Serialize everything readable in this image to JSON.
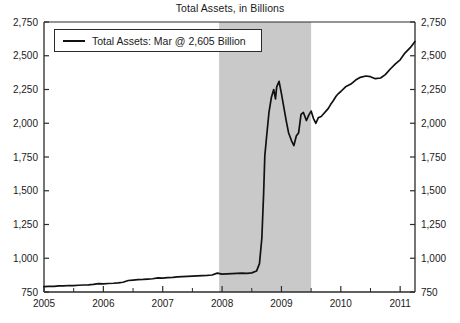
{
  "chart_data": {
    "type": "line",
    "title": "Total Assets, in Billions",
    "xlabel": "",
    "ylabel": "",
    "ylim": [
      750,
      2750
    ],
    "xlim": [
      2005.0,
      2011.25
    ],
    "ytick_labels": [
      "2,750",
      "2,500",
      "2,250",
      "2,000",
      "1,750",
      "1,500",
      "1,250",
      "1,000",
      "750"
    ],
    "ytick_values": [
      2750,
      2500,
      2250,
      2000,
      1750,
      1500,
      1250,
      1000,
      750
    ],
    "xtick_labels": [
      "2005",
      "2006",
      "2007",
      "2008",
      "2009",
      "2010",
      "2011"
    ],
    "xtick_values": [
      2005,
      2006,
      2007,
      2008,
      2009,
      2010,
      2011
    ],
    "minor_xticks": [
      2005.5,
      2006.5,
      2007.5,
      2008.5,
      2009.5,
      2010.5
    ],
    "grid": false,
    "legend_position": "top-left",
    "legend": [
      {
        "name": "Total Assets: Mar @ 2,605 Billion",
        "color": "#111111"
      }
    ],
    "dual_y_axis": true,
    "shaded_regions": [
      {
        "name": "recession",
        "x_start": 2007.95,
        "x_end": 2009.5,
        "color": "#c9c9c9"
      }
    ],
    "series": [
      {
        "name": "Total Assets",
        "color": "#111111",
        "x": [
          2005.0,
          2005.08,
          2005.17,
          2005.25,
          2005.33,
          2005.42,
          2005.5,
          2005.58,
          2005.67,
          2005.75,
          2005.83,
          2005.92,
          2006.0,
          2006.08,
          2006.17,
          2006.25,
          2006.33,
          2006.42,
          2006.5,
          2006.58,
          2006.67,
          2006.75,
          2006.83,
          2006.92,
          2007.0,
          2007.08,
          2007.17,
          2007.25,
          2007.33,
          2007.42,
          2007.5,
          2007.58,
          2007.67,
          2007.75,
          2007.83,
          2007.92,
          2008.0,
          2008.08,
          2008.17,
          2008.25,
          2008.33,
          2008.42,
          2008.5,
          2008.58,
          2008.63,
          2008.67,
          2008.7,
          2008.72,
          2008.75,
          2008.79,
          2008.83,
          2008.87,
          2008.9,
          2008.92,
          2008.96,
          2009.0,
          2009.04,
          2009.08,
          2009.12,
          2009.17,
          2009.21,
          2009.25,
          2009.29,
          2009.33,
          2009.37,
          2009.42,
          2009.46,
          2009.5,
          2009.54,
          2009.58,
          2009.62,
          2009.67,
          2009.71,
          2009.75,
          2009.79,
          2009.83,
          2009.87,
          2009.92,
          2009.96,
          2010.0,
          2010.08,
          2010.17,
          2010.25,
          2010.33,
          2010.42,
          2010.5,
          2010.58,
          2010.67,
          2010.75,
          2010.83,
          2010.92,
          2011.0,
          2011.08,
          2011.17,
          2011.25
        ],
        "values": [
          790,
          792,
          791,
          795,
          796,
          798,
          797,
          800,
          802,
          803,
          806,
          812,
          810,
          813,
          815,
          818,
          822,
          835,
          838,
          841,
          843,
          846,
          848,
          855,
          853,
          856,
          858,
          862,
          864,
          866,
          868,
          870,
          872,
          873,
          876,
          890,
          882,
          884,
          886,
          888,
          890,
          888,
          892,
          905,
          960,
          1150,
          1480,
          1760,
          1900,
          2080,
          2190,
          2250,
          2180,
          2270,
          2310,
          2220,
          2120,
          2020,
          1930,
          1870,
          1835,
          1905,
          1930,
          2065,
          2080,
          2020,
          2060,
          2090,
          2035,
          2000,
          2040,
          2050,
          2070,
          2090,
          2110,
          2140,
          2165,
          2200,
          2220,
          2235,
          2270,
          2290,
          2320,
          2340,
          2350,
          2345,
          2330,
          2335,
          2360,
          2400,
          2440,
          2470,
          2520,
          2560,
          2605
        ]
      }
    ]
  }
}
